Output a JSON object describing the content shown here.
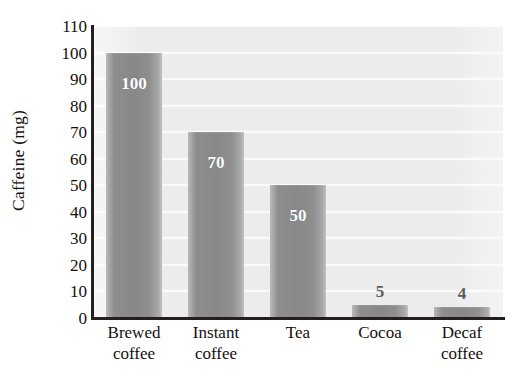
{
  "chart_data": {
    "type": "bar",
    "title": "",
    "subtitle": "",
    "xlabel": "",
    "ylabel": "Caffeine (mg)",
    "categories": [
      "Brewed coffee",
      "Instant coffee",
      "Tea",
      "Cocoa",
      "Decaf coffee"
    ],
    "category_lines": [
      [
        "Brewed",
        "coffee"
      ],
      [
        "Instant",
        "coffee"
      ],
      [
        "Tea",
        ""
      ],
      [
        "Cocoa",
        ""
      ],
      [
        "Decaf",
        "coffee"
      ]
    ],
    "values": [
      100,
      70,
      50,
      5,
      4
    ],
    "value_labels": [
      "100",
      "70",
      "50",
      "5",
      "4"
    ],
    "ylim": [
      0,
      110
    ],
    "ytick_values": [
      0,
      10,
      20,
      30,
      40,
      50,
      60,
      70,
      80,
      90,
      100,
      110
    ],
    "ytick_labels": [
      "0",
      "10",
      "20",
      "30",
      "40",
      "50",
      "60",
      "70",
      "80",
      "90",
      "100",
      "110"
    ],
    "grid": true,
    "grid_axis": "y",
    "legend": "none",
    "bar_color": "#8d8d8e",
    "plot_background": "#ececed",
    "gridline_color": "#ffffff",
    "axis_color": "#231f1e",
    "inside_label_color": "#ffffff",
    "outside_label_color": "#5d5d5d"
  }
}
